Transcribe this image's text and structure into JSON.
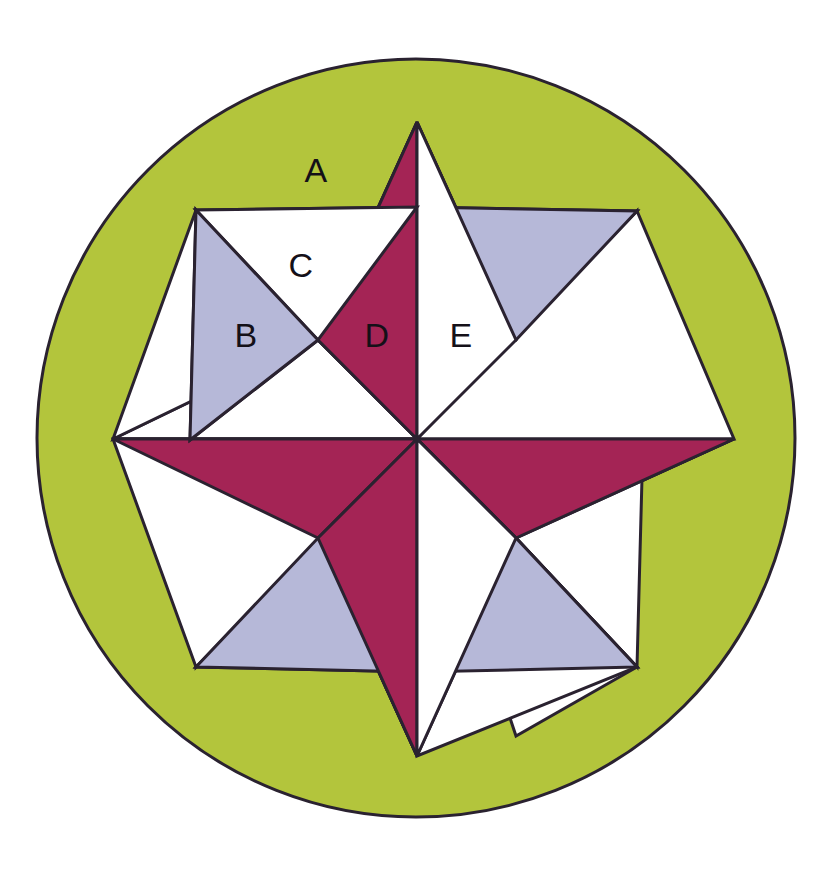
{
  "figure": {
    "type": "geometric-diagram",
    "canvas": {
      "width": 839,
      "height": 875,
      "background": "#ffffff"
    }
  },
  "colors": {
    "circle_fill": "#b3c53c",
    "magenta": "#a42455",
    "lavender": "#b6b8d8",
    "white": "#ffffff",
    "outline": "#2a2230",
    "label_text": "#141018"
  },
  "geometry": {
    "circle": {
      "cx": 416,
      "cy": 438,
      "r": 379
    },
    "star": {
      "center_x": 417,
      "center_y": 439,
      "points": 8,
      "outer_radius_axis": 317,
      "outer_radius_diagonal": 318,
      "inner_radius": 140
    }
  },
  "labels": [
    {
      "id": "A",
      "text": "A",
      "x": 316,
      "y": 173,
      "region": "circle-background-segment"
    },
    {
      "id": "B",
      "text": "B",
      "x": 246,
      "y": 338,
      "region": "lavender-triangle-upper-left"
    },
    {
      "id": "C",
      "text": "C",
      "x": 301,
      "y": 268,
      "region": "white-triangle-upper-left"
    },
    {
      "id": "D",
      "text": "D",
      "x": 377,
      "y": 338,
      "region": "magenta-triangle-top-left-half"
    },
    {
      "id": "E",
      "text": "E",
      "x": 461,
      "y": 338,
      "region": "white-triangle-top-right-half"
    }
  ],
  "legend_note": "Regions A through E are labelled areas of the figure."
}
